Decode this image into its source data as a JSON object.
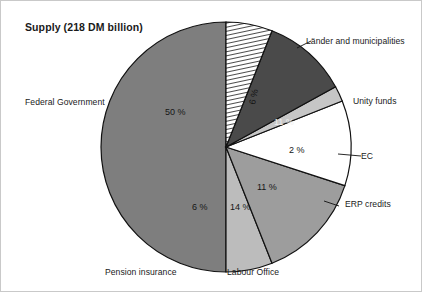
{
  "chart_data": {
    "type": "pie",
    "title": "Supply (218 DM billion)",
    "unit": "DM billion",
    "total": 218,
    "legend_position": "callout-labels",
    "grid": false,
    "categories": [
      "Länder and municipalities",
      "Unity funds",
      "EC",
      "ERP credits",
      "Labour Office",
      "Pension insurance",
      "Federal Government"
    ],
    "values": [
      6,
      11,
      2,
      11,
      14,
      6,
      50
    ],
    "value_labels": [
      "6 %",
      "11 %",
      "2 %",
      "11 %",
      "14 %",
      "6 %",
      "50 %"
    ],
    "slices": [
      {
        "label": "Länder and municipalities",
        "value": 6,
        "value_label": "6 %",
        "fill": "hatched",
        "color": "#ffffff",
        "start_angle": 0,
        "end_angle": 21.6
      },
      {
        "label": "Unity funds",
        "value": 11,
        "value_label": "11 %",
        "fill": "solid",
        "color": "#4a4a4a",
        "start_angle": 21.6,
        "end_angle": 61.2
      },
      {
        "label": "EC",
        "value": 2,
        "value_label": "2 %",
        "fill": "solid",
        "color": "#c6c6c6",
        "start_angle": 61.2,
        "end_angle": 68.4
      },
      {
        "label": "ERP credits",
        "value": 11,
        "value_label": "11 %",
        "fill": "solid",
        "color": "#ffffff",
        "start_angle": 68.4,
        "end_angle": 108.0
      },
      {
        "label": "Labour Office",
        "value": 14,
        "value_label": "14 %",
        "fill": "solid",
        "color": "#9d9d9d",
        "start_angle": 108.0,
        "end_angle": 158.4
      },
      {
        "label": "Pension insurance",
        "value": 6,
        "value_label": "6 %",
        "fill": "solid",
        "color": "#bcbcbc",
        "start_angle": 158.4,
        "end_angle": 180.0
      },
      {
        "label": "Federal Government",
        "value": 50,
        "value_label": "50 %",
        "fill": "solid",
        "color": "#7e7e7e",
        "start_angle": 180.0,
        "end_angle": 360.0
      }
    ]
  },
  "callouts": {
    "lander": "Länder and municipalities",
    "unity_funds": "Unity funds",
    "ec": "EC",
    "erp_credits": "ERP credits",
    "labour_office": "Labour Office",
    "pension_insurance": "Pension insurance",
    "federal_government": "Federal Government"
  },
  "percent_text": {
    "lander": "6 %",
    "unity_funds": "11 %",
    "ec": "2 %",
    "erp_credits": "11 %",
    "labour_office": "14 %",
    "pension_insurance": "6 %",
    "federal_government": "50 %"
  }
}
